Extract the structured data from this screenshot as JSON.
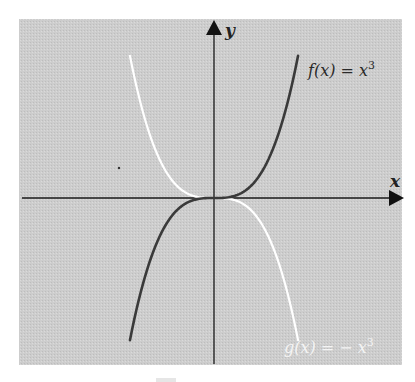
{
  "chart_data": {
    "type": "line",
    "title": "",
    "xlabel": "x",
    "ylabel": "y",
    "grid": false,
    "axis_ticks": "none",
    "xlim": [
      -2.1,
      4.6
    ],
    "ylim": [
      -10.3,
      11
    ],
    "series": [
      {
        "name": "f(x) = x^3",
        "label": "f(x) = x",
        "label_exp": "3",
        "expression": "x^3",
        "color": "#3a3a3a",
        "x": [
          -2,
          -1.5,
          -1,
          -0.5,
          0,
          0.5,
          1,
          1.5,
          2
        ],
        "values": [
          -8,
          -3.375,
          -1,
          -0.125,
          0,
          0.125,
          1,
          3.375,
          8
        ]
      },
      {
        "name": "g(x) = -x^3",
        "label": "g(x) = − x",
        "label_exp": "3",
        "expression": "-x^3",
        "color": "#ffffff",
        "x": [
          -2,
          -1.5,
          -1,
          -0.5,
          0,
          0.5,
          1,
          1.5,
          2
        ],
        "values": [
          8,
          3.375,
          1,
          0.125,
          0,
          -0.125,
          -1,
          -3.375,
          -8
        ]
      }
    ]
  },
  "colors": {
    "panel": "#cfcfcf",
    "axis": "#1a1a1a",
    "page": "#ffffff"
  }
}
